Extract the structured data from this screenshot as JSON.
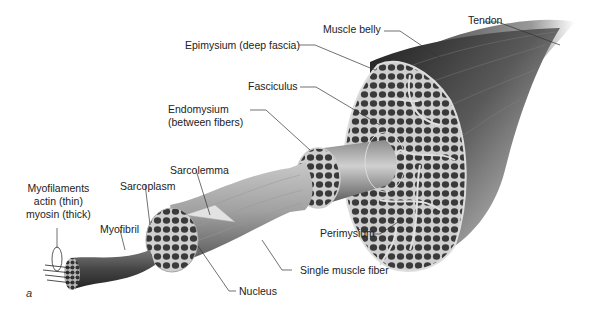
{
  "diagram": {
    "panel_label": "a",
    "labels": {
      "tendon": "Tendon",
      "muscle_belly": "Muscle belly",
      "epimysium": "Epimysium (deep fascia)",
      "fasciculus": "Fasciculus",
      "endomysium_line1": "Endomysium",
      "endomysium_line2": "(between fibers)",
      "sarcolemma": "Sarcolemma",
      "sarcoplasm": "Sarcoplasm",
      "myofilaments_line1": "Myofilaments",
      "myofilaments_line2": "actin (thin)",
      "myofilaments_line3": "myosin (thick)",
      "myofibril": "Myofibril",
      "perimysium": "Perimysium",
      "single_muscle_fiber": "Single muscle fiber",
      "nucleus": "Nucleus"
    },
    "colors": {
      "background": "#ffffff",
      "muscle_dark": "#2a2a2a",
      "muscle_mid": "#6a6a6a",
      "muscle_light": "#bdbdbd",
      "connective_tissue": "#d8d8d8",
      "leader_line": "#333333"
    }
  }
}
